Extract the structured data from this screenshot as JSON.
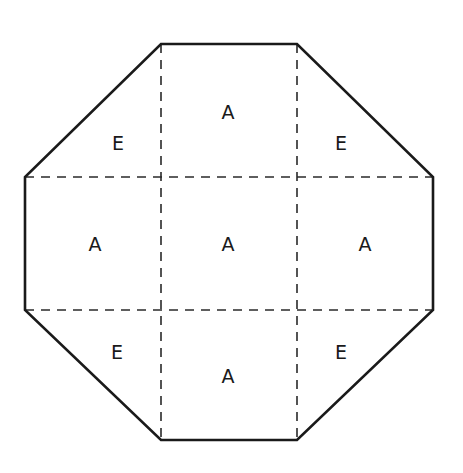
{
  "diagram": {
    "shape": "octagon",
    "outline_color": "#1a1a1a",
    "dash_color": "#2a2a2a",
    "vertices": [
      [
        161,
        44
      ],
      [
        297,
        44
      ],
      [
        433,
        177
      ],
      [
        433,
        310
      ],
      [
        297,
        440
      ],
      [
        161,
        440
      ],
      [
        25,
        310
      ],
      [
        25,
        177
      ]
    ],
    "dashed_lines": {
      "vertical_x": [
        161,
        297
      ],
      "horizontal_y": [
        177,
        310
      ]
    },
    "regions": [
      {
        "id": "top-left",
        "label": "E",
        "x": 118,
        "y": 143
      },
      {
        "id": "top-center",
        "label": "A",
        "x": 228,
        "y": 112
      },
      {
        "id": "top-right",
        "label": "E",
        "x": 341,
        "y": 143
      },
      {
        "id": "middle-left",
        "label": "A",
        "x": 95,
        "y": 244
      },
      {
        "id": "center",
        "label": "A",
        "x": 228,
        "y": 244
      },
      {
        "id": "middle-right",
        "label": "A",
        "x": 365,
        "y": 244
      },
      {
        "id": "bottom-left",
        "label": "E",
        "x": 117,
        "y": 352
      },
      {
        "id": "bottom-center",
        "label": "A",
        "x": 228,
        "y": 376
      },
      {
        "id": "bottom-right",
        "label": "E",
        "x": 341,
        "y": 352
      }
    ]
  }
}
